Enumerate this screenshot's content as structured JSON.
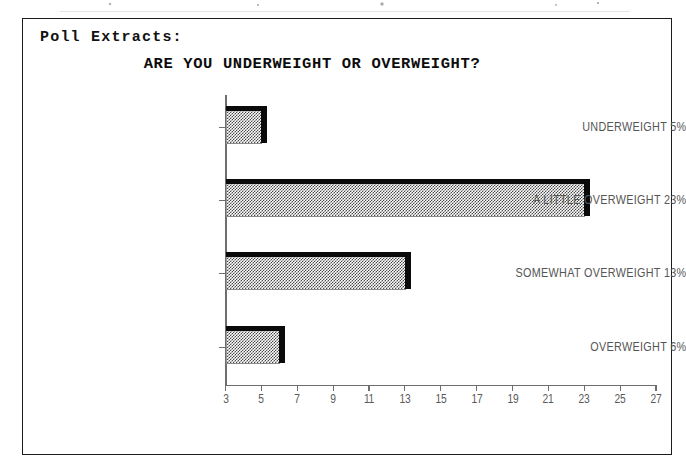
{
  "document": {
    "section_label": "Poll Extracts:"
  },
  "chart_data": {
    "type": "bar",
    "orientation": "horizontal",
    "title": "ARE YOU UNDERWEIGHT OR OVERWEIGHT?",
    "xlabel": "",
    "ylabel": "",
    "categories": [
      "UNDERWEIGHT 5%",
      "A LITTLE OVERWEIGHT 23%",
      "SOMEWHAT OVERWEIGHT 13%",
      "OVERWEIGHT 6%"
    ],
    "values": [
      5,
      23,
      13,
      6
    ],
    "value_unit": "%",
    "xlim": [
      3,
      27
    ],
    "xticks": [
      3,
      5,
      7,
      9,
      11,
      13,
      15,
      17,
      19,
      21,
      23,
      25,
      27
    ],
    "xtick_labels": [
      "3",
      "5",
      "7",
      "9",
      "11",
      "13",
      "15",
      "17",
      "19",
      "21",
      "23",
      "25",
      "27"
    ],
    "grid": false,
    "legend": null,
    "bar_style": {
      "fill": "checkerboard-dither-gray",
      "fill_color": "#808080",
      "edge_color": "#0a0a0a",
      "shadow": true
    }
  }
}
